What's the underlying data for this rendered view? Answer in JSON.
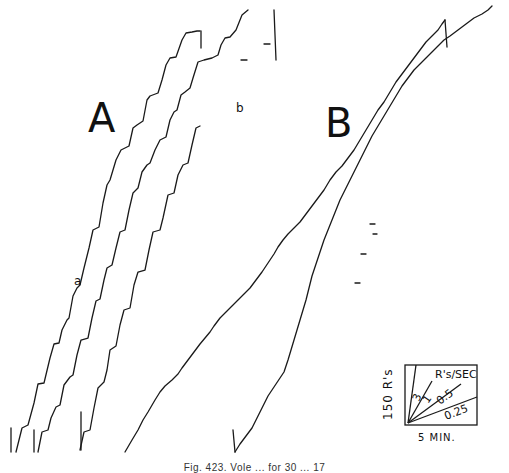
{
  "figure": {
    "panels": [
      {
        "id": "A",
        "label": "A"
      },
      {
        "id": "B",
        "label": "B"
      }
    ],
    "curve_labels": {
      "a": "a",
      "b": "b"
    },
    "legend": {
      "y_scale_label": "150 R's",
      "x_scale_label": "5 MIN.",
      "rate_unit_label": "R's/SEC",
      "rate_values": [
        "3",
        "1",
        "0.5",
        "0.25"
      ]
    },
    "caption": "Fig. 423.   Vole ... for 30 ... 17"
  },
  "colors": {
    "ink": "#1a1a1a",
    "background": "#ffffff"
  }
}
